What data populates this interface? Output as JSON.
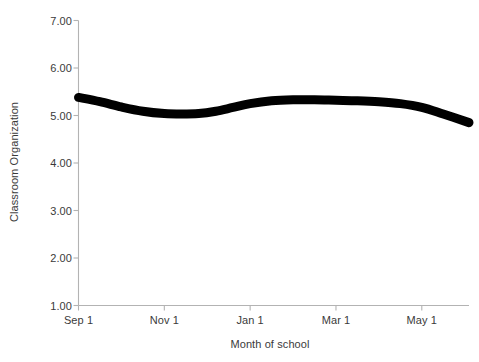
{
  "chart_data": {
    "type": "line",
    "title": "",
    "xlabel": "Month of school",
    "ylabel": "Classroom Organization",
    "ylim": [
      1.0,
      7.0
    ],
    "ytick_labels": [
      "7.00",
      "6.00",
      "5.00",
      "4.00",
      "3.00",
      "2.00",
      "1.00"
    ],
    "ytick_values": [
      7.0,
      6.0,
      5.0,
      4.0,
      3.0,
      2.0,
      1.0
    ],
    "xtick_labels": [
      "Sep 1",
      "Nov 1",
      "Jan 1",
      "Mar 1",
      "May 1"
    ],
    "xtick_values": [
      0,
      2,
      4,
      6,
      8
    ],
    "xlim": [
      0,
      9.1
    ],
    "grid": false,
    "legend": null,
    "series": [
      {
        "name": "Classroom Organization",
        "color": "#000000",
        "line_width": 9,
        "x": [
          0.0,
          0.5,
          1.0,
          1.5,
          2.0,
          2.4,
          2.8,
          3.2,
          3.6,
          4.0,
          4.5,
          5.0,
          5.5,
          6.0,
          6.5,
          7.0,
          7.5,
          8.0,
          8.5,
          9.1
        ],
        "y": [
          5.38,
          5.29,
          5.18,
          5.09,
          5.04,
          5.03,
          5.04,
          5.09,
          5.17,
          5.25,
          5.31,
          5.33,
          5.33,
          5.32,
          5.31,
          5.29,
          5.25,
          5.17,
          5.03,
          4.85
        ]
      }
    ]
  },
  "axes": {
    "axis_color": "#b3b3b3",
    "tick_color": "#b3b3b3",
    "text_color": "#3a3a3a",
    "background": "#ffffff"
  }
}
